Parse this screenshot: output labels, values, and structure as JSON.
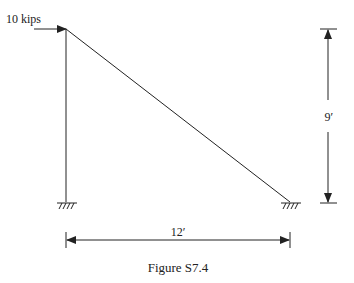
{
  "figure": {
    "caption": "Figure S7.4",
    "load": {
      "label": "10 kips",
      "magnitude": 10,
      "unit": "kips",
      "direction": "right"
    },
    "dimensions": {
      "height_label": "9′",
      "width_label": "12′",
      "height_ft": 9,
      "width_ft": 12
    },
    "members": [
      "vertical column",
      "inclined member"
    ],
    "supports": [
      "fixed",
      "fixed"
    ],
    "line_color": "#222222"
  }
}
